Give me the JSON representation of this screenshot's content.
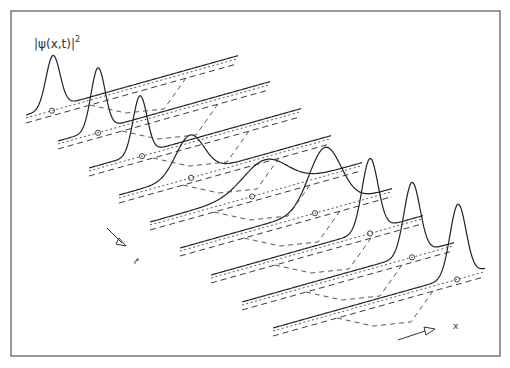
{
  "figure": {
    "title_label": "|ψ(x,t)|",
    "title_exponent": "2",
    "axis_x_label": "x",
    "axis_t_label": "t",
    "frame_color": "#555555",
    "line_color": "#2a2a2a"
  },
  "tracks": [
    {
      "index": 0,
      "start": [
        26,
        115
      ],
      "peak_x": 53,
      "peak_h": 52,
      "width": 7,
      "marker_x": 52
    },
    {
      "index": 1,
      "start": [
        58,
        141
      ],
      "peak_x": 98,
      "peak_h": 62,
      "width": 7,
      "marker_x": 98
    },
    {
      "index": 2,
      "start": [
        89,
        168
      ],
      "peak_x": 140,
      "peak_h": 58,
      "width": 7,
      "marker_x": 142
    },
    {
      "index": 3,
      "start": [
        119,
        195
      ],
      "peak_x": 190,
      "peak_h": 40,
      "width": 14,
      "marker_x": 191
    },
    {
      "index": 4,
      "start": [
        150,
        222
      ],
      "peak_x": 265,
      "peak_h": 30,
      "width": 22,
      "marker_x": 252
    },
    {
      "index": 5,
      "start": [
        180,
        248
      ],
      "peak_x": 325,
      "peak_h": 60,
      "width": 16,
      "marker_x": 315
    },
    {
      "index": 6,
      "start": [
        211,
        275
      ],
      "peak_x": 370,
      "peak_h": 72,
      "width": 8,
      "marker_x": 370
    },
    {
      "index": 7,
      "start": [
        242,
        302
      ],
      "peak_x": 412,
      "peak_h": 72,
      "width": 8,
      "marker_x": 412
    },
    {
      "index": 8,
      "start": [
        273,
        328
      ],
      "peak_x": 458,
      "peak_h": 72,
      "width": 8,
      "marker_x": 457
    }
  ]
}
